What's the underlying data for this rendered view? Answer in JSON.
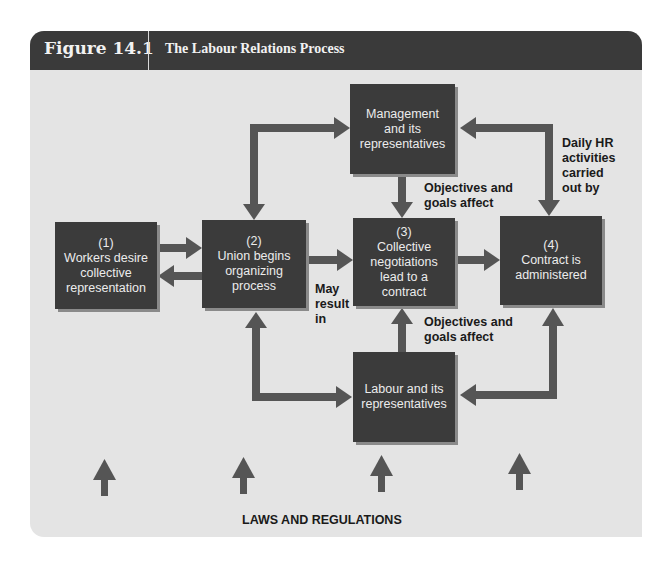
{
  "header": {
    "figure_number": "Figure 14.1",
    "title": "The Labour Relations Process"
  },
  "boxes": {
    "workers": {
      "step": "(1)",
      "text": "Workers desire collective representation"
    },
    "union": {
      "step": "(2)",
      "text": "Union begins organizing process"
    },
    "negotiations": {
      "step": "(3)",
      "text": "Collective negotiations lead to a contract"
    },
    "contract": {
      "step": "(4)",
      "text": "Contract is administered"
    },
    "management": {
      "text": "Management and its representatives"
    },
    "labour": {
      "text": "Labour and its representatives"
    }
  },
  "notes": {
    "may_result": "May result in",
    "mgmt_objectives": "Objectives and goals affect",
    "labour_objectives": "Objectives and goals affect",
    "daily_hr": "Daily HR activities carried out by"
  },
  "footer": {
    "laws": "LAWS AND REGULATIONS"
  },
  "colors": {
    "panel_bg": "#e4e4e4",
    "header_bg": "#3a3a3a",
    "box_bg": "#3b3b3b",
    "arrow": "#555555"
  }
}
